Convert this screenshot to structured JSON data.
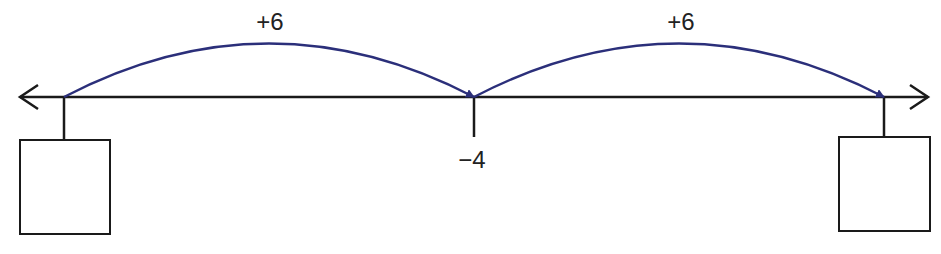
{
  "diagram": {
    "type": "number-line",
    "colors": {
      "line": "#1a1a1a",
      "arc": "#2b2f7a",
      "text": "#222222"
    },
    "marked_value": {
      "label": "−4"
    },
    "jumps": [
      {
        "label": "+6",
        "from": "blank-left",
        "to": "−4"
      },
      {
        "label": "+6",
        "from": "−4",
        "to": "blank-right"
      }
    ],
    "answer_boxes": [
      {
        "position": "left",
        "value": ""
      },
      {
        "position": "right",
        "value": ""
      }
    ]
  }
}
